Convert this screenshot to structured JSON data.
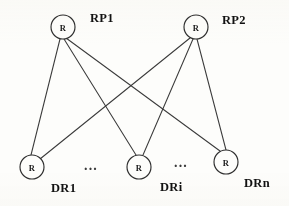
{
  "figure": {
    "kind": "bipartite-graph-diagram",
    "background_color": "#fdfdfb",
    "stroke_color": "#3b3b3b",
    "node_fill": "#fdfdfb",
    "node_stroke": "#2e2e2e",
    "label_color": "#121212",
    "node_radius": 12
  },
  "nodes": {
    "rp1": {
      "letter": "R",
      "label": "RP1",
      "cx": 63,
      "cy": 27,
      "label_x": 90,
      "label_y": 22
    },
    "rp2": {
      "letter": "R",
      "label": "RP2",
      "cx": 196,
      "cy": 27,
      "label_x": 222,
      "label_y": 24
    },
    "dr1": {
      "letter": "R",
      "label": "DR1",
      "cx": 32,
      "cy": 167,
      "label_x": 51,
      "label_y": 192
    },
    "dri": {
      "letter": "R",
      "label": "DRi",
      "cx": 139,
      "cy": 167,
      "label_x": 160,
      "label_y": 191
    },
    "drn": {
      "letter": "R",
      "label": "DRn",
      "cx": 226,
      "cy": 162,
      "label_x": 244,
      "label_y": 187
    }
  },
  "edges": [
    {
      "id": "rp1-dr1",
      "from": "rp1",
      "to": "dr1"
    },
    {
      "id": "rp1-dri",
      "from": "rp1",
      "to": "dri"
    },
    {
      "id": "rp1-drn",
      "from": "rp1",
      "to": "drn"
    },
    {
      "id": "rp2-dr1",
      "from": "rp2",
      "to": "dr1"
    },
    {
      "id": "rp2-dri",
      "from": "rp2",
      "to": "dri"
    },
    {
      "id": "rp2-drn",
      "from": "rp2",
      "to": "drn"
    }
  ],
  "ellipses": [
    {
      "id": "ellipsis-left",
      "text": "...",
      "x": 91,
      "y": 170
    },
    {
      "id": "ellipsis-right",
      "text": "...",
      "x": 181,
      "y": 167
    }
  ]
}
